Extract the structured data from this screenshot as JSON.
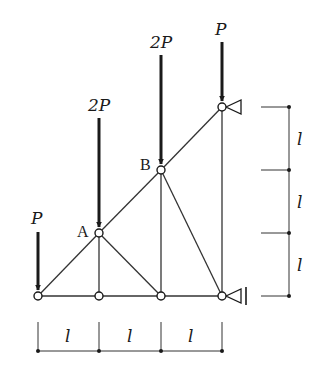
{
  "diagram": {
    "type": "truss",
    "nodes": [
      {
        "id": "n1",
        "x": 38,
        "y": 296,
        "label": ""
      },
      {
        "id": "n2",
        "x": 99,
        "y": 296,
        "label": ""
      },
      {
        "id": "n3",
        "x": 161,
        "y": 296,
        "label": ""
      },
      {
        "id": "n4",
        "x": 222,
        "y": 296,
        "label": ""
      },
      {
        "id": "A",
        "x": 99,
        "y": 233,
        "label": "A"
      },
      {
        "id": "B",
        "x": 161,
        "y": 170,
        "label": "B"
      },
      {
        "id": "n7",
        "x": 222,
        "y": 107,
        "label": ""
      }
    ],
    "members": [
      [
        "n1",
        "n2"
      ],
      [
        "n2",
        "n3"
      ],
      [
        "n3",
        "n4"
      ],
      [
        "n1",
        "A"
      ],
      [
        "A",
        "B"
      ],
      [
        "B",
        "n7"
      ],
      [
        "A",
        "n2"
      ],
      [
        "A",
        "n3"
      ],
      [
        "B",
        "n3"
      ],
      [
        "B",
        "n4"
      ],
      [
        "n7",
        "n4"
      ]
    ],
    "loads": [
      {
        "label": "P",
        "node": "n1"
      },
      {
        "label": "2P",
        "node": "A"
      },
      {
        "label": "2P",
        "node": "B"
      },
      {
        "label": "P",
        "node": "n7"
      }
    ],
    "supports": [
      {
        "node": "n7",
        "type": "pin-horizontal"
      },
      {
        "node": "n4",
        "type": "roller-horizontal"
      }
    ],
    "node_labels": {
      "A": "A",
      "B": "B"
    },
    "dimensions": {
      "horizontal": [
        "l",
        "l",
        "l"
      ],
      "vertical": [
        "l",
        "l",
        "l"
      ]
    },
    "load_labels": {
      "p1": "P",
      "p2": "2P",
      "p3": "2P",
      "p4": "P"
    }
  }
}
